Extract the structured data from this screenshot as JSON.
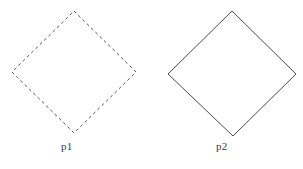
{
  "figure": {
    "type": "diagram",
    "background_color": "#ffffff",
    "width": 303,
    "height": 169,
    "shapes": [
      {
        "id": "p1",
        "name": "dashed-diamond",
        "label": "p1",
        "stroke_style": "dashed",
        "stroke_color": "#555555",
        "stroke_width": 1,
        "fill": "none",
        "center_x": 74,
        "center_y": 72,
        "half_width": 62,
        "half_height": 61,
        "vertices": [
          {
            "x": 74,
            "y": 11
          },
          {
            "x": 136,
            "y": 72
          },
          {
            "x": 74,
            "y": 133
          },
          {
            "x": 12,
            "y": 72
          }
        ],
        "label_x": 61,
        "label_y": 141
      },
      {
        "id": "p2",
        "name": "solid-diamond",
        "label": "p2",
        "stroke_style": "solid",
        "stroke_color": "#4a4a4a",
        "stroke_width": 1,
        "fill": "none",
        "center_x": 232,
        "center_y": 73,
        "half_width": 64,
        "half_height": 62,
        "vertices": [
          {
            "x": 232,
            "y": 11
          },
          {
            "x": 296,
            "y": 74
          },
          {
            "x": 233,
            "y": 136
          },
          {
            "x": 168,
            "y": 74
          }
        ],
        "label_x": 216,
        "label_y": 141
      }
    ],
    "dash_pattern": "3 3"
  }
}
